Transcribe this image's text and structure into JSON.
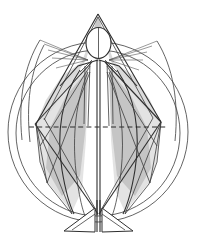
{
  "image": {
    "title": "Geometric proportion study of a standing human figure",
    "kind": "line-diagram",
    "width": 197,
    "height": 242,
    "background_color": "#ffffff"
  },
  "palette": {
    "line_dark": "#2e2e2e",
    "line_mid": "#3c3c3c",
    "line_light": "#555555",
    "shade_gray": "#d2d2d2",
    "shade_soft": "#dcdcdc",
    "shade_dark": "#bdbdbd",
    "paper": "#ffffff"
  },
  "geometry": {
    "center_x": 98,
    "apex": {
      "x": 98,
      "y": 14
    },
    "head_ellipse": {
      "cx": 98.5,
      "cy": 43,
      "rx": 12.5,
      "ry": 15.5
    },
    "outer_circle": {
      "cx": 98,
      "cy": 132,
      "r": 91
    },
    "inner_circle": {
      "cx": 98,
      "cy": 133,
      "r": 83
    },
    "dashed_axis": {
      "y": 127,
      "x1": 29,
      "x2": 167
    },
    "left_waist_vertex": {
      "x": 35,
      "y": 124
    },
    "right_waist_vertex": {
      "x": 161,
      "y": 122
    },
    "left_hip_vertex": {
      "x": 47,
      "y": 183
    },
    "right_hip_vertex": {
      "x": 150,
      "y": 183
    },
    "left_foot": {
      "x": 72,
      "y": 228
    },
    "right_foot": {
      "x": 124,
      "y": 228
    },
    "shoulder_left": {
      "x": 78,
      "y": 66
    },
    "shoulder_right": {
      "x": 119,
      "y": 66
    },
    "arm_fan_left_tip": {
      "x": 40,
      "y": 42
    },
    "arm_fan_right_tip": {
      "x": 156,
      "y": 42
    }
  },
  "elements": {
    "outer_circle_label": "outer circumscribing circle",
    "inner_circle_label": "inner circle",
    "head_label": "head ellipse",
    "apex_triangle_label": "apex triangle over head",
    "arm_fan_left_label": "left radiating arm lines",
    "arm_fan_right_label": "right radiating arm lines",
    "torso_label": "torso vertical construction lines",
    "dashed_axis_label": "horizontal dashed reference axis",
    "left_kite_label": "left shaded kite panel",
    "right_kite_label": "right shaded kite panel",
    "legs_label": "leg construction lines",
    "left_foot_label": "left foot",
    "right_foot_label": "right foot"
  }
}
